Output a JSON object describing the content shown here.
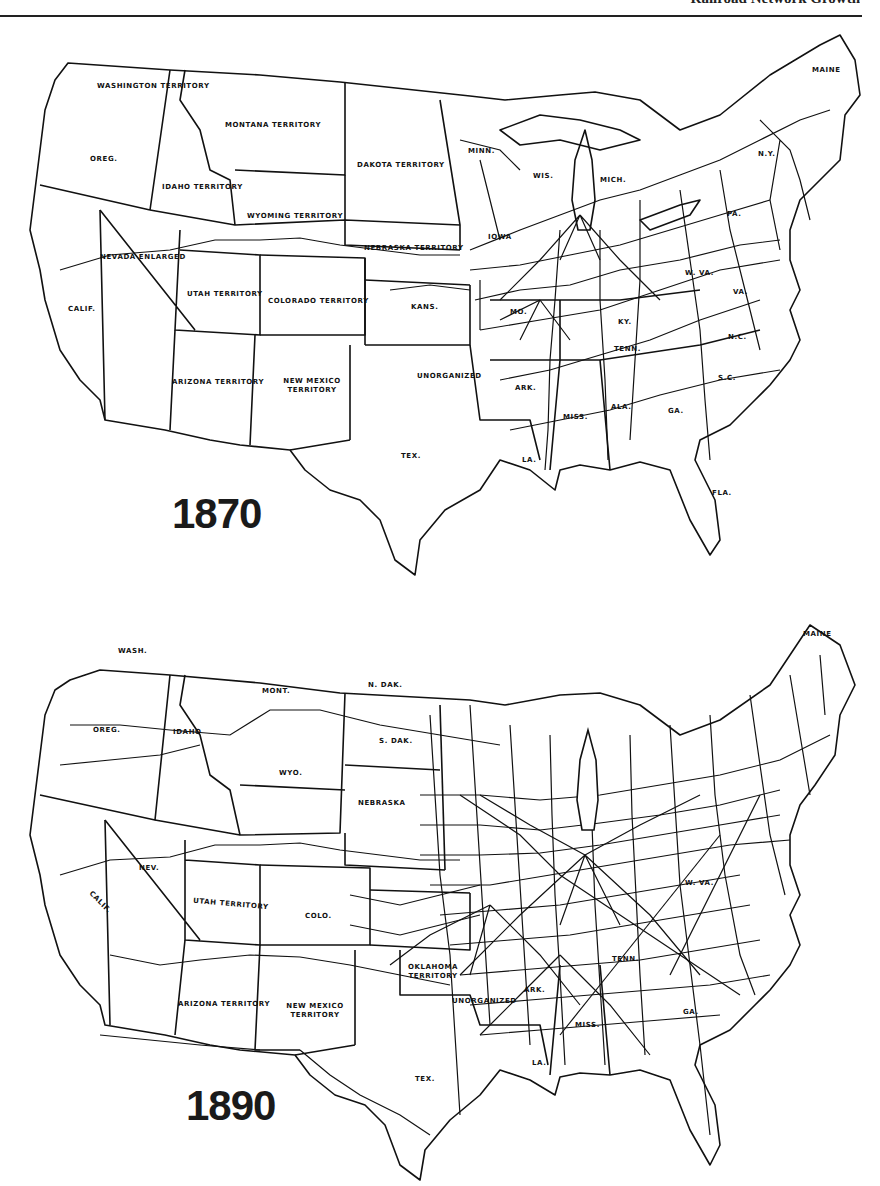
{
  "page": {
    "header_text": "Railroad Network Growth",
    "accent_color": "#111111",
    "background_color": "#ffffff"
  },
  "maps": [
    {
      "year": "1870",
      "labels": {
        "washington": "Washington Territory",
        "montana": "Montana Territory",
        "oregon": "Oreg.",
        "idaho": "Idaho Territory",
        "wyoming": "Wyoming Territory",
        "dakota": "Dakota Territory",
        "minnesota": "Minn.",
        "wisconsin": "Wis.",
        "michigan": "Mich.",
        "iowa": "Iowa",
        "nebraska": "Nebraska Territory",
        "nevada": "Nevada Enlarged",
        "california": "Calif.",
        "utah": "Utah Territory",
        "colorado": "Colorado Territory",
        "kansas": "Kans.",
        "missouri": "Mo.",
        "kentucky": "Ky.",
        "west_virginia": "W. Va.",
        "virginia": "Va.",
        "north_carolina": "N.C.",
        "tennessee": "Tenn.",
        "south_carolina": "S.C.",
        "arizona": "Arizona Territory",
        "new_mexico": "New Mexico Territory",
        "unorganized": "Unorganized",
        "arkansas": "Ark.",
        "mississippi": "Miss.",
        "alabama": "Ala.",
        "georgia": "Ga.",
        "louisiana": "La.",
        "texas": "Tex.",
        "florida": "Fla.",
        "pennsylvania": "Pa.",
        "new_york": "N.Y.",
        "maine": "Maine"
      }
    },
    {
      "year": "1890",
      "labels": {
        "washington": "Wash.",
        "montana": "Mont.",
        "north_dakota": "N. Dak.",
        "oregon": "Oreg.",
        "idaho": "Idaho",
        "south_dakota": "S. Dak.",
        "wyoming": "Wyo.",
        "nebraska": "Nebraska",
        "nevada": "Nev.",
        "california": "Calif.",
        "utah": "Utah Territory",
        "colorado": "Colo.",
        "arizona": "Arizona Territory",
        "new_mexico": "New Mexico Territory",
        "oklahoma": "Oklahoma Territory",
        "unorganized": "Unorganized",
        "arkansas": "Ark.",
        "mississippi": "Miss.",
        "louisiana": "La.",
        "texas": "Tex.",
        "tennessee": "Tenn.",
        "west_virginia": "W. Va.",
        "georgia": "Ga.",
        "maine": "Maine"
      }
    }
  ]
}
